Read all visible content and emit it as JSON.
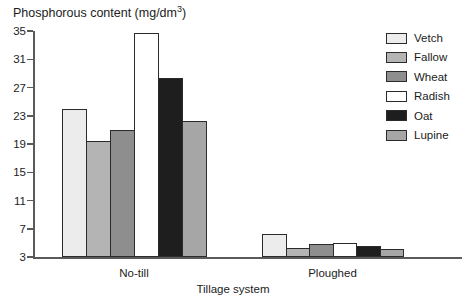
{
  "title": {
    "prefix": "Phosphorous content (mg/dm",
    "superscript": "3",
    "suffix": ")"
  },
  "chart_data": {
    "type": "bar",
    "title": "Phosphorous content (mg/dm3)",
    "xlabel": "Tillage system",
    "ylabel": "Phosphorous content (mg/dm3)",
    "categories": [
      "No-till",
      "Ploughed"
    ],
    "series": [
      {
        "name": "Vetch",
        "color": "#ececec",
        "values": [
          23.9,
          6.3
        ]
      },
      {
        "name": "Fallow",
        "color": "#b4b4b4",
        "values": [
          19.4,
          4.3
        ]
      },
      {
        "name": "Wheat",
        "color": "#8e8e8e",
        "values": [
          21.0,
          4.8
        ]
      },
      {
        "name": "Radish",
        "color": "#ffffff",
        "values": [
          34.7,
          5.0
        ]
      },
      {
        "name": "Oat",
        "color": "#1e1e1e",
        "values": [
          28.3,
          4.5
        ]
      },
      {
        "name": "Lupine",
        "color": "#a6a6a6",
        "values": [
          22.3,
          4.1
        ]
      }
    ],
    "y_ticks": [
      3,
      7,
      11,
      15,
      19,
      23,
      27,
      31,
      35
    ],
    "ylim": [
      3,
      35
    ],
    "grid": false,
    "legend_position": "upper right",
    "axis_color": "#5a5a5a",
    "bar_border_color": "#2b2b2b",
    "background_color": "#ffffff"
  }
}
